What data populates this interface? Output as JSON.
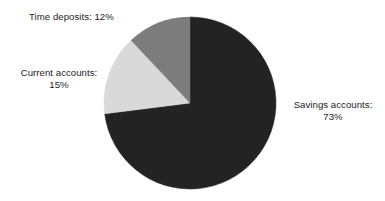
{
  "chart_data": {
    "type": "pie",
    "title": "",
    "subtitle": "",
    "xlabel": "",
    "ylabel": "",
    "grid": false,
    "legend": "none",
    "labels_position": "outside",
    "start_angle_deg": 0,
    "direction": "clockwise",
    "categories": [
      "Savings accounts",
      "Current accounts",
      "Time deposits"
    ],
    "values": [
      73,
      15,
      12
    ],
    "unit": "%",
    "slices": [
      {
        "name": "Savings accounts",
        "value": 73,
        "label": "Savings accounts:\n73%",
        "color": "#232323",
        "start_deg": 0,
        "end_deg": 262.8
      },
      {
        "name": "Current accounts",
        "value": 15,
        "label": "Current accounts:\n15%",
        "color": "#d9d9d9",
        "start_deg": 262.8,
        "end_deg": 316.8
      },
      {
        "name": "Time deposits",
        "value": 12,
        "label": "Time deposits: 12%",
        "color": "#7c7c7c",
        "start_deg": 316.8,
        "end_deg": 360
      }
    ],
    "geometry": {
      "center_x": 190,
      "center_y": 103,
      "radius": 86
    },
    "background_color": "#ffffff",
    "text_color": "#1c1c1c"
  }
}
